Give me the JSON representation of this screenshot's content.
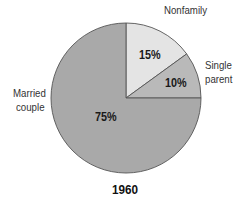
{
  "chart_data": {
    "type": "pie",
    "title": "1960",
    "slices": [
      {
        "label": "Nonfamily",
        "value": 15,
        "value_label": "15%",
        "color": "#e4e4e4"
      },
      {
        "label": "Single parent",
        "value": 10,
        "value_label": "10%",
        "color": "#b9b9b9"
      },
      {
        "label": "Married couple",
        "value": 75,
        "value_label": "75%",
        "color": "#a9a9a9"
      }
    ],
    "start_angle": "12 o'clock, clockwise",
    "legend": "none (direct labels)"
  },
  "labels": {
    "nonfamily": "Nonfamily",
    "single_line1": "Single",
    "single_line2": "parent",
    "married_line1": "Married",
    "married_line2": "couple",
    "pct_nonfamily": "15%",
    "pct_single": "10%",
    "pct_married": "75%",
    "title": "1960"
  }
}
